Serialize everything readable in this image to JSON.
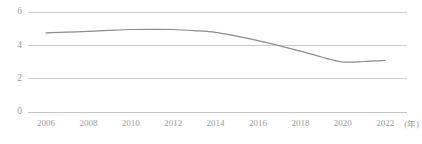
{
  "chart_data": {
    "type": "line",
    "title": "",
    "subtitle": "",
    "xlabel": "",
    "ylabel": "",
    "x_unit_label": "(年)",
    "grid": true,
    "legend": false,
    "legend_position": "none",
    "xlim": [
      2006,
      2022
    ],
    "ylim": [
      0,
      6
    ],
    "y_ticks": [
      0,
      2,
      4,
      6
    ],
    "y_tick_labels": [
      "0",
      "2",
      "4",
      "6"
    ],
    "x_ticks": [
      2006,
      2008,
      2010,
      2012,
      2014,
      2016,
      2018,
      2020,
      2022
    ],
    "x_tick_labels": [
      "2006",
      "2008",
      "2010",
      "2012",
      "2014",
      "2016",
      "2018",
      "2020",
      "2022"
    ],
    "series": [
      {
        "name": "",
        "color": "#8c8c8c",
        "x": [
          2006,
          2007,
          2008,
          2009,
          2010,
          2011,
          2012,
          2013,
          2014,
          2015,
          2016,
          2017,
          2018,
          2019,
          2020,
          2021,
          2022
        ],
        "values": [
          4.75,
          4.79,
          4.84,
          4.9,
          4.95,
          4.96,
          4.95,
          4.88,
          4.78,
          4.55,
          4.28,
          3.98,
          3.65,
          3.3,
          3.0,
          3.03,
          3.1
        ]
      }
    ]
  },
  "colors": {
    "background": "#ffffff",
    "gridline": "#c8c8c8",
    "axis": "#bdbdbd",
    "line": "#8c8c8c",
    "tick_text": "#9a9a9a"
  }
}
